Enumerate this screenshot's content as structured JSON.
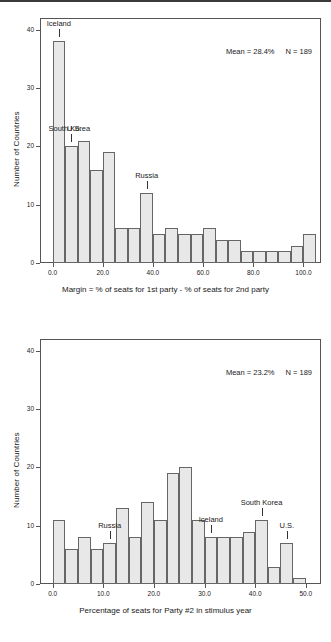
{
  "figure": {
    "panels": [
      {
        "id": "margin-histogram",
        "stat_mean": "Mean = 28.4%",
        "stat_n": "N = 189",
        "annotations": [
          {
            "label": "Iceland",
            "x": 2.5,
            "tick_top": 38,
            "text_dx": 0,
            "text_dy": 0
          },
          {
            "label": "South Korea",
            "x": 7.5,
            "tick_top": 20,
            "text_dx": -2,
            "text_dy": 0
          },
          {
            "label": "U.S.",
            "x": 7.5,
            "tick_top": 20,
            "text_dx": 3,
            "text_dy": 0
          },
          {
            "label": "Russia",
            "x": 37.5,
            "tick_top": 12,
            "text_dx": 0,
            "text_dy": 0
          }
        ]
      },
      {
        "id": "party2-seats-histogram",
        "stat_mean": "Mean = 23.2%",
        "stat_n": "N = 189",
        "annotations": [
          {
            "label": "Russia",
            "x": 11.25,
            "tick_top": 7,
            "text_dx": 0,
            "text_dy": 0
          },
          {
            "label": "Iceland",
            "x": 31.25,
            "tick_top": 8,
            "text_dx": 0,
            "text_dy": 0
          },
          {
            "label": "South Korea",
            "x": 41.25,
            "tick_top": 11,
            "text_dx": 0,
            "text_dy": 0
          },
          {
            "label": "U.S.",
            "x": 46.25,
            "tick_top": 7,
            "text_dx": 0,
            "text_dy": 0
          }
        ]
      }
    ]
  },
  "chart_data": [
    {
      "type": "bar",
      "title": "",
      "xlabel": "Margin = % of seats for 1st party - % of seats for 2nd party",
      "ylabel": "Number of Countries",
      "xlim": [
        -5,
        107
      ],
      "ylim": [
        0,
        42
      ],
      "xticks": [
        0,
        20,
        40,
        60,
        80,
        100
      ],
      "xticklabels": [
        "0.0",
        "20.0",
        "40.0",
        "60.0",
        "80.0",
        "100.0"
      ],
      "yticks": [
        0,
        10,
        20,
        30,
        40
      ],
      "yticklabels": [
        "0",
        "10",
        "20",
        "30",
        "40"
      ],
      "grid": false,
      "legend": "none",
      "bin_width": 5,
      "bin_starts": [
        0,
        5,
        10,
        15,
        20,
        25,
        30,
        35,
        40,
        45,
        50,
        55,
        60,
        65,
        70,
        75,
        80,
        85,
        90,
        95,
        100
      ],
      "categories": [
        "0-5",
        "5-10",
        "10-15",
        "15-20",
        "20-25",
        "25-30",
        "30-35",
        "35-40",
        "40-45",
        "45-50",
        "50-55",
        "55-60",
        "60-65",
        "65-70",
        "70-75",
        "75-80",
        "80-85",
        "85-90",
        "90-95",
        "95-100",
        "100-105"
      ],
      "values": [
        38,
        20,
        21,
        16,
        19,
        6,
        6,
        12,
        5,
        6,
        5,
        5,
        6,
        4,
        4,
        2,
        2,
        2,
        2,
        3,
        5
      ]
    },
    {
      "type": "bar",
      "title": "",
      "xlabel": "Percentage of seats for Party #2 in stimulus year",
      "ylabel": "Number of Countries",
      "xlim": [
        -2.5,
        53
      ],
      "ylim": [
        0,
        42
      ],
      "xticks": [
        0,
        10,
        20,
        30,
        40,
        50
      ],
      "xticklabels": [
        "0.0",
        "10.0",
        "20.0",
        "30.0",
        "40.0",
        "50.0"
      ],
      "yticks": [
        0,
        10,
        20,
        30,
        40
      ],
      "yticklabels": [
        "0",
        "10",
        "20",
        "30",
        "40"
      ],
      "grid": false,
      "legend": "none",
      "bin_width": 2.5,
      "bin_starts": [
        0,
        2.5,
        5,
        7.5,
        10,
        12.5,
        15,
        17.5,
        20,
        22.5,
        25,
        27.5,
        30,
        32.5,
        35,
        37.5,
        40,
        42.5,
        45,
        47.5
      ],
      "categories": [
        "0-2.5",
        "2.5-5",
        "5-7.5",
        "7.5-10",
        "10-12.5",
        "12.5-15",
        "15-17.5",
        "17.5-20",
        "20-22.5",
        "22.5-25",
        "25-27.5",
        "27.5-30",
        "30-32.5",
        "32.5-35",
        "35-37.5",
        "37.5-40",
        "40-42.5",
        "42.5-45",
        "45-47.5",
        "47.5-50"
      ],
      "values": [
        11,
        6,
        8,
        6,
        7,
        13,
        8,
        14,
        11,
        19,
        20,
        11,
        8,
        8,
        8,
        9,
        11,
        3,
        7,
        1
      ]
    }
  ]
}
